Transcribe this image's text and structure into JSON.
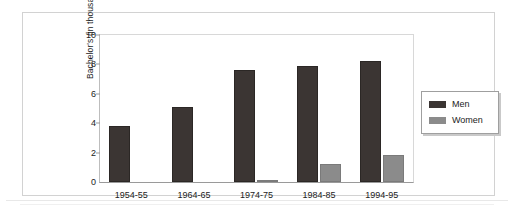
{
  "chart_data": {
    "type": "bar",
    "title": "",
    "xlabel": "",
    "ylabel": "Bachelor's (in thousands)",
    "categories": [
      "1954-55",
      "1964-65",
      "1974-75",
      "1984-85",
      "1994-95"
    ],
    "series": [
      {
        "name": "Men",
        "color": "#3b3533",
        "values": [
          3.8,
          5.1,
          7.6,
          7.9,
          8.2
        ]
      },
      {
        "name": "Women",
        "color": "#8b8b8b",
        "values": [
          0,
          0,
          0.15,
          1.2,
          1.85
        ]
      }
    ],
    "ylim": [
      0,
      10
    ],
    "yticks": [
      "0",
      "2",
      "4",
      "6",
      "8",
      "10"
    ],
    "grid": false,
    "legend_position": "right"
  },
  "legend": {
    "entries": [
      {
        "label": "Men"
      },
      {
        "label": "Women"
      }
    ]
  }
}
